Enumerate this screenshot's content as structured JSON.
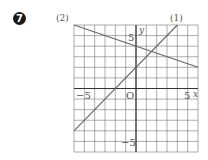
{
  "problem": {
    "number": "7"
  },
  "chart_data": {
    "type": "line",
    "title": "",
    "xlabel": "x",
    "ylabel": "y",
    "xlim": [
      -6,
      6
    ],
    "ylim": [
      -6,
      6
    ],
    "grid": true,
    "origin_label": "O",
    "tick_labels": {
      "x": [
        "-5",
        "5"
      ],
      "y": [
        "5",
        "-5"
      ]
    },
    "series": [
      {
        "name": "(1)",
        "equation": "y = x + 2",
        "slope": 1,
        "intercept": 2,
        "points": [
          [
            -6,
            -4
          ],
          [
            4,
            6
          ]
        ]
      },
      {
        "name": "(2)",
        "equation": "y = -x/3 + 4",
        "slope": -0.3333,
        "intercept": 4,
        "points": [
          [
            -6,
            6
          ],
          [
            6,
            2
          ]
        ]
      }
    ],
    "colors": {
      "grid": "#777777",
      "axis": "#333333",
      "line": "#666666"
    }
  },
  "labels": {
    "line1": "(1)",
    "line2": "(2)",
    "x_axis": "x",
    "y_axis": "y",
    "origin": "O",
    "x_neg5": "−5",
    "x_pos5": "5",
    "y_pos5": "5",
    "y_neg5": "−5"
  }
}
